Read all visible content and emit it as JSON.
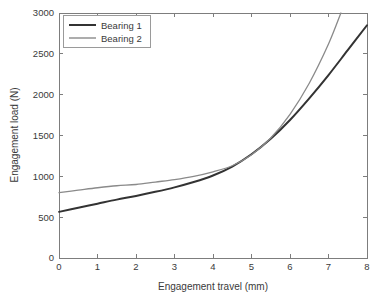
{
  "chart_data": {
    "type": "line",
    "title": "",
    "xlabel": "Engagement travel (mm)",
    "ylabel": "Engagement load (N)",
    "xlim": [
      0,
      8
    ],
    "ylim": [
      0,
      3000
    ],
    "xticks": [
      "0",
      "1",
      "2",
      "3",
      "4",
      "5",
      "6",
      "7",
      "8"
    ],
    "yticks": [
      "0",
      "500",
      "1000",
      "1500",
      "2000",
      "2500",
      "3000"
    ],
    "grid": false,
    "legend_position": "upper-left",
    "x": [
      0,
      0.5,
      1,
      1.5,
      2,
      2.5,
      3,
      3.5,
      4,
      4.5,
      5,
      5.5,
      6,
      6.5,
      7,
      7.5,
      8
    ],
    "series": [
      {
        "name": "Bearing 1",
        "color": "#333333",
        "values": [
          565,
          615,
          665,
          715,
          760,
          810,
          865,
          930,
          1010,
          1120,
          1270,
          1460,
          1690,
          1955,
          2240,
          2545,
          2850
        ]
      },
      {
        "name": "Bearing 2",
        "color": "#8a8a8a",
        "values": [
          800,
          830,
          860,
          885,
          900,
          930,
          960,
          1000,
          1055,
          1130,
          1265,
          1470,
          1760,
          2140,
          2620,
          3210,
          3900
        ]
      }
    ]
  },
  "legend": {
    "entries": [
      {
        "label": "Bearing 1"
      },
      {
        "label": "Bearing 2"
      }
    ]
  },
  "axes": {
    "x_title": "Engagement travel (mm)",
    "y_title": "Engagement load (N)"
  },
  "colors": {
    "series_1": "#333333",
    "series_2": "#8a8a8a",
    "axis": "#7d7d7d",
    "text": "#3a3a3a",
    "background": "#ffffff"
  }
}
